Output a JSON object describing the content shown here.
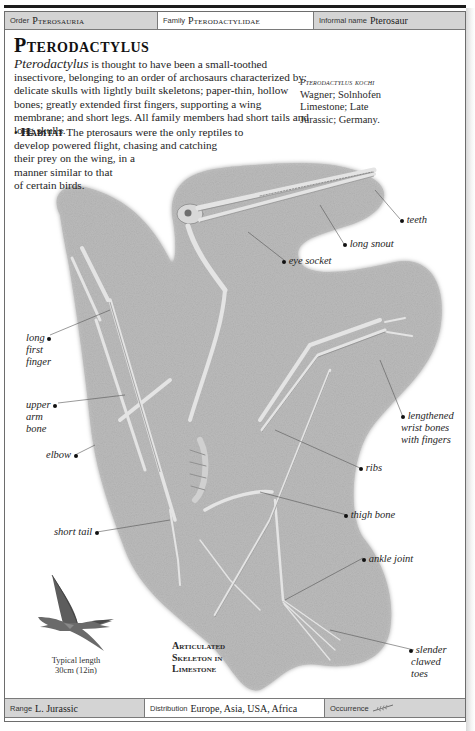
{
  "header": {
    "order": {
      "label": "Order",
      "value": "Pterosauria"
    },
    "family": {
      "label": "Family",
      "value": "Pterodactylidae"
    },
    "informal_name": {
      "label": "Informal name",
      "value": "Pterosaur"
    }
  },
  "title": "Pterodactylus",
  "intro": {
    "genus_italic": "Pterodactylus",
    "text": " is thought to have been a small-toothed insectivore, belonging to an order of archosaurs characterized by: delicate skulls with lightly built skeletons; paper-thin, hollow bones; greatly extended first fingers, supporting a wing membrane; and short legs. All family members had short tails and long skulls."
  },
  "habitat": {
    "bullet": "•",
    "heading": "Habitat",
    "lines": [
      " The pterosaurs were the only reptiles to",
      "develop powered flight, chasing and catching",
      "their prey on the wing, in a",
      "manner similar to that",
      "of certain birds."
    ]
  },
  "specimen": {
    "name": "Pterodactylus kochi",
    "lines": [
      "Wagner; Solnhofen",
      "Limestone; Late",
      "Jurassic; Germany."
    ]
  },
  "callouts": [
    {
      "id": "teeth",
      "lines": [
        "teeth"
      ]
    },
    {
      "id": "long-snout",
      "lines": [
        "long snout"
      ]
    },
    {
      "id": "eye-socket",
      "lines": [
        "eye socket"
      ]
    },
    {
      "id": "long-first-finger",
      "lines": [
        "long",
        "first",
        "finger"
      ]
    },
    {
      "id": "upper-arm-bone",
      "lines": [
        "upper",
        "arm",
        "bone"
      ]
    },
    {
      "id": "elbow",
      "lines": [
        "elbow"
      ]
    },
    {
      "id": "lengthened-wrist-bones",
      "lines": [
        "lengthened",
        "wrist bones",
        "with fingers"
      ]
    },
    {
      "id": "ribs",
      "lines": [
        "ribs"
      ]
    },
    {
      "id": "thigh-bone",
      "lines": [
        "thigh bone"
      ]
    },
    {
      "id": "short-tail",
      "lines": [
        "short tail"
      ]
    },
    {
      "id": "ankle-joint",
      "lines": [
        "ankle joint"
      ]
    },
    {
      "id": "slender-clawed-toes",
      "lines": [
        "slender",
        "clawed",
        "toes"
      ]
    }
  ],
  "caption": [
    "Articulated",
    "Skeleton in",
    "Limestone"
  ],
  "scale": {
    "lines": [
      "Typical length",
      "30cm (12in)"
    ]
  },
  "footer": {
    "range": {
      "label": "Range",
      "value": "L. Jurassic"
    },
    "distribution": {
      "label": "Distribution",
      "value": "Europe, Asia, USA, Africa"
    },
    "occurrence": {
      "label": "Occurrence",
      "icon": "feather-icon"
    }
  },
  "colors": {
    "slab": "#a9a9a9",
    "bar_shade": "#d4d4d4",
    "border": "#7a7a7a"
  }
}
